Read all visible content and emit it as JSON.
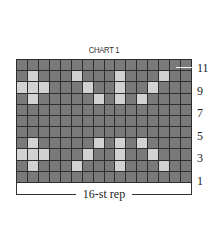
{
  "chart": {
    "title": "CHART 1",
    "columns": 16,
    "rows": 11,
    "colors": {
      "background_cell": "#7a7a7a",
      "contrast_cell": "#d2d2d2",
      "grid_line": "#2e2e2e"
    },
    "row_labels": [
      {
        "label": "11",
        "row": 11
      },
      {
        "label": "9",
        "row": 9
      },
      {
        "label": "7",
        "row": 7
      },
      {
        "label": "5",
        "row": 5
      },
      {
        "label": "3",
        "row": 3
      },
      {
        "label": "1",
        "row": 1
      }
    ],
    "repeat_label": "16-st rep",
    "pattern": [
      {
        "row": 11,
        "light_cols": []
      },
      {
        "row": 10,
        "light_cols": [
          2,
          6,
          10,
          14
        ]
      },
      {
        "row": 9,
        "light_cols": [
          1,
          2,
          3,
          7,
          10,
          13
        ]
      },
      {
        "row": 8,
        "light_cols": [
          2,
          8,
          10,
          12
        ]
      },
      {
        "row": 7,
        "light_cols": []
      },
      {
        "row": 6,
        "light_cols": []
      },
      {
        "row": 5,
        "light_cols": []
      },
      {
        "row": 4,
        "light_cols": [
          2,
          8,
          10,
          12
        ]
      },
      {
        "row": 3,
        "light_cols": [
          1,
          2,
          3,
          7,
          10,
          13
        ]
      },
      {
        "row": 2,
        "light_cols": [
          2,
          6,
          10,
          14
        ]
      },
      {
        "row": 1,
        "light_cols": []
      }
    ]
  }
}
